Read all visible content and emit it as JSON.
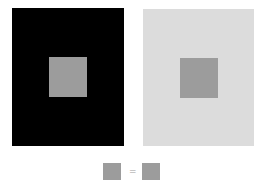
{
  "diagram": {
    "type": "simultaneous-contrast-illusion",
    "left_panel": {
      "background": "#000000",
      "inner_square_color": "#9c9c9c"
    },
    "right_panel": {
      "background": "#dcdcdc",
      "inner_square_color": "#9c9c9c"
    },
    "comparison": {
      "left_square_color": "#9c9c9c",
      "right_square_color": "#9c9c9c",
      "operator": "="
    }
  }
}
